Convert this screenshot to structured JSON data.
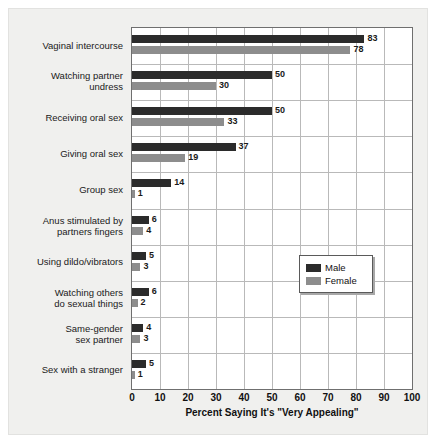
{
  "chart_data": {
    "type": "bar",
    "orientation": "horizontal",
    "title": "",
    "xlabel": "Percent Saying It's \"Very Appealing\"",
    "ylabel": "",
    "xlim": [
      0,
      100
    ],
    "xticks": [
      0,
      10,
      20,
      30,
      40,
      50,
      60,
      70,
      80,
      90,
      100
    ],
    "grid": "vertical-and-category-separators",
    "legend_position": "center-right",
    "categories": [
      "Vaginal intercourse",
      "Watching partner\nundress",
      "Receiving oral sex",
      "Giving oral sex",
      "Group sex",
      "Anus stimulated by\npartners fingers",
      "Using dildo/vibrators",
      "Watching others\ndo sexual things",
      "Same-gender\nsex partner",
      "Sex with a stranger"
    ],
    "series": [
      {
        "name": "Male",
        "color": "#2b2b2b",
        "values": [
          83,
          50,
          50,
          37,
          14,
          6,
          5,
          6,
          4,
          5
        ]
      },
      {
        "name": "Female",
        "color": "#8d8d8d",
        "values": [
          78,
          30,
          33,
          19,
          1,
          4,
          3,
          2,
          3,
          1
        ]
      }
    ]
  },
  "legend": {
    "items": [
      {
        "label": "Male",
        "color": "#2b2b2b"
      },
      {
        "label": "Female",
        "color": "#8d8d8d"
      }
    ]
  }
}
